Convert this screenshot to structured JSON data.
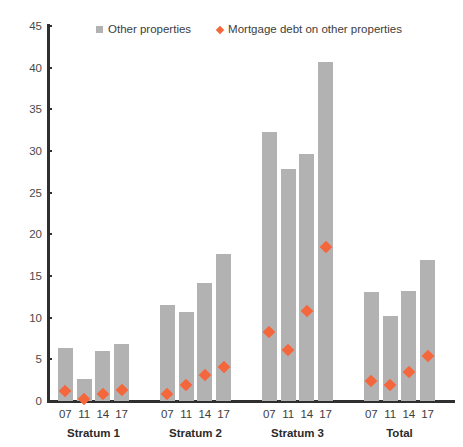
{
  "legend": {
    "position": "top",
    "entries": [
      {
        "icon": "square-swatch-icon",
        "label": "Other properties",
        "color": "#b2b2b2"
      },
      {
        "icon": "diamond-marker-icon",
        "label": "Mortgage debt on other properties",
        "color": "#f4663c"
      }
    ]
  },
  "colors": {
    "bar": "#b2b2b2",
    "marker": "#f4663c",
    "axis": "#2f2f2f",
    "background": "#ffffff",
    "text": "#3d3d3d"
  },
  "chart_data": {
    "type": "bar",
    "title": "",
    "subtitle": "",
    "xlabel": "",
    "ylabel": "",
    "ylim": [
      0,
      45
    ],
    "ytick_step": 5,
    "yticks": [
      0,
      5,
      10,
      15,
      20,
      25,
      30,
      35,
      40,
      45
    ],
    "ytick_labels": [
      "0",
      "5",
      "10",
      "15",
      "20",
      "25",
      "30",
      "35",
      "40",
      "45"
    ],
    "grid": false,
    "groups": [
      "Stratum 1",
      "Stratum 2",
      "Stratum 3",
      "Total"
    ],
    "categories": [
      "07",
      "11",
      "14",
      "17"
    ],
    "series": [
      {
        "name": "Other properties",
        "type": "bar",
        "color": "#b2b2b2",
        "values": [
          [
            6.4,
            2.6,
            6.0,
            6.9
          ],
          [
            11.5,
            10.7,
            14.2,
            17.7
          ],
          [
            32.3,
            27.9,
            29.6,
            40.7
          ],
          [
            13.1,
            10.2,
            13.2,
            16.9
          ]
        ]
      },
      {
        "name": "Mortgage debt on other properties",
        "type": "scatter",
        "marker": "diamond",
        "color": "#f4663c",
        "values": [
          [
            1.2,
            0.3,
            0.9,
            1.3
          ],
          [
            0.9,
            1.9,
            3.1,
            4.1
          ],
          [
            8.3,
            6.1,
            10.8,
            18.5
          ],
          [
            2.4,
            1.9,
            3.5,
            5.4
          ]
        ]
      }
    ]
  }
}
